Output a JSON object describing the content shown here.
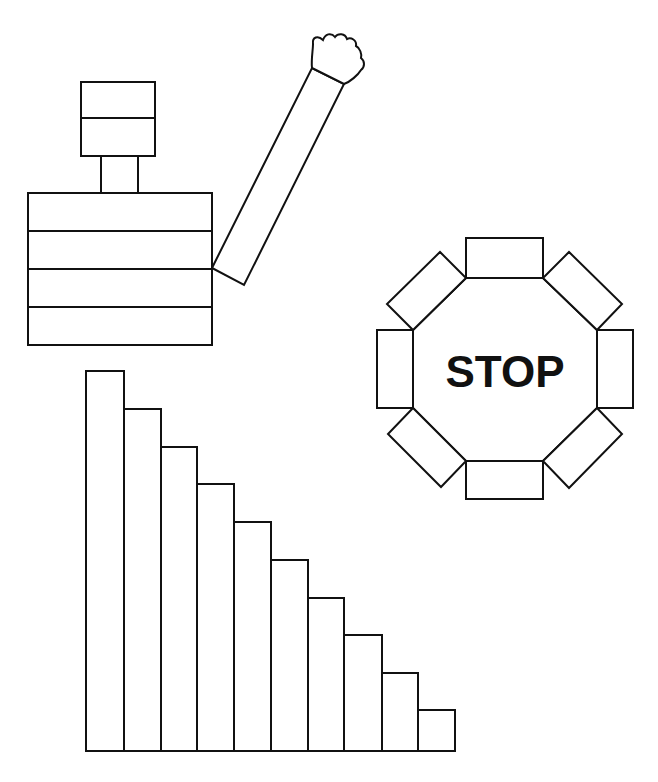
{
  "figure": {
    "background": "#ffffff",
    "stroke_color": "#111111"
  },
  "stop_sign": {
    "label": "STOP"
  },
  "staircase": {
    "bar_count": 10,
    "bar_tops_px": [
      371,
      409,
      447,
      484,
      522,
      560,
      598,
      635,
      673,
      710
    ],
    "baseline_px": 751
  }
}
